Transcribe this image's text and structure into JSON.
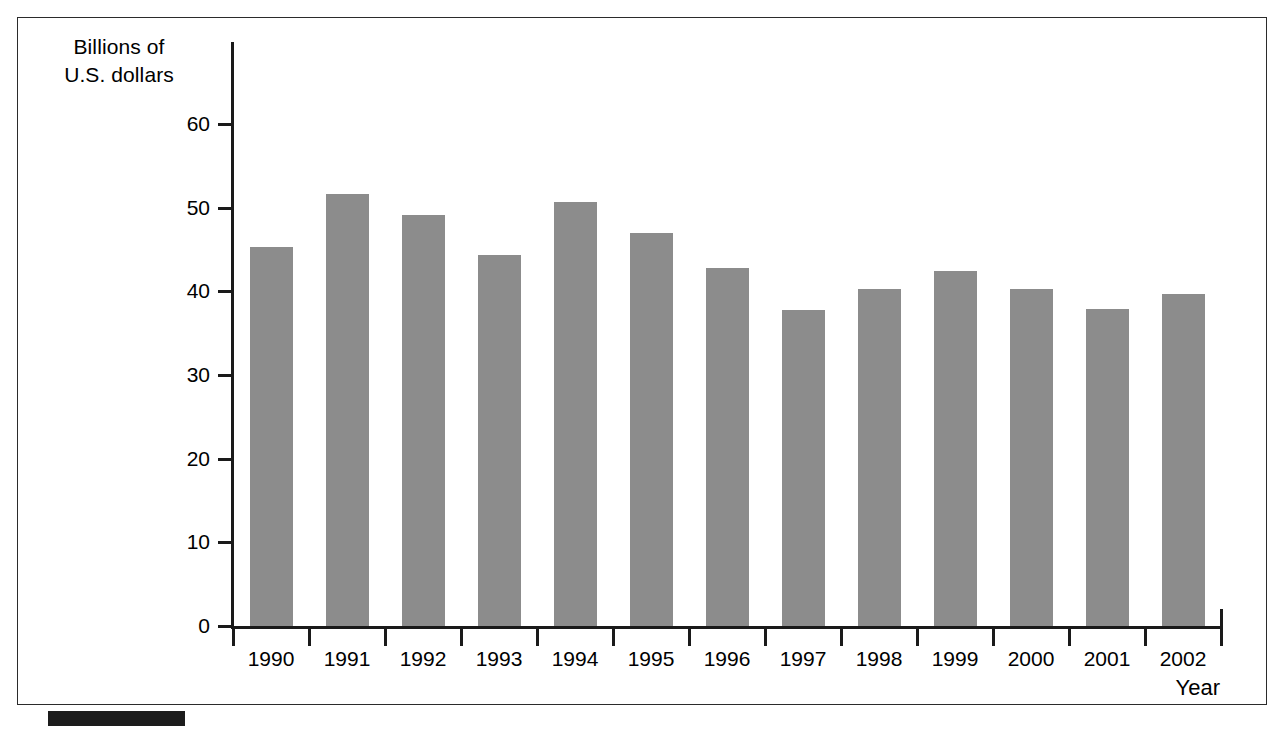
{
  "figure": {
    "frame": true,
    "caption_rule": true
  },
  "chart_data": {
    "type": "bar",
    "title": "",
    "subtitle": "",
    "ylabel": "Billions of\nU.S. dollars",
    "xlabel": "Year",
    "categories": [
      "1990",
      "1991",
      "1992",
      "1993",
      "1994",
      "1995",
      "1996",
      "1997",
      "1998",
      "1999",
      "2000",
      "2001",
      "2002"
    ],
    "values": [
      45.3,
      51.6,
      49.1,
      44.3,
      50.7,
      47.0,
      42.8,
      37.8,
      40.3,
      42.4,
      40.3,
      37.9,
      39.7
    ],
    "yticks": [
      0,
      10,
      20,
      30,
      40,
      50,
      60
    ],
    "ytick_labels": [
      "0",
      "10",
      "20",
      "30",
      "40",
      "50",
      "60"
    ],
    "ylim": [
      0,
      60
    ],
    "grid": false,
    "legend": null,
    "bar_color": "#8c8c8c",
    "axis_color": "#1a1a1a",
    "background": "#ffffff"
  }
}
